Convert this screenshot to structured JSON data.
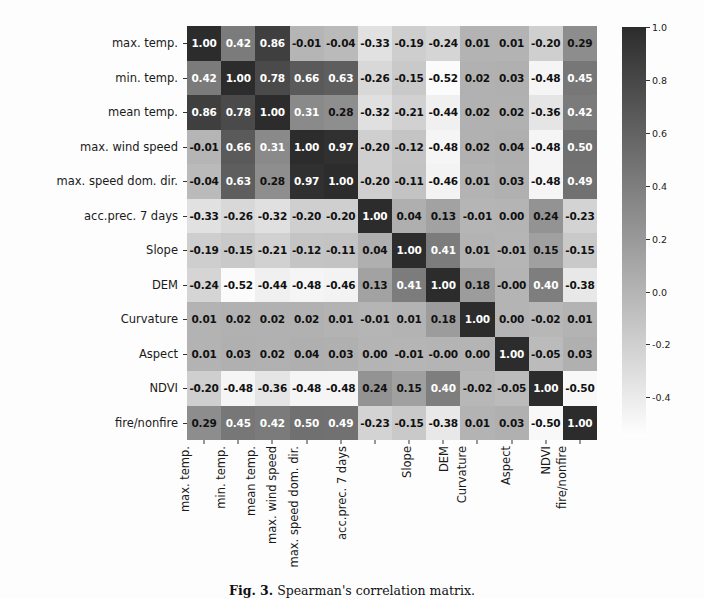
{
  "figure": {
    "caption_label": "Fig. 3.",
    "caption_text": "Spearman's correlation matrix."
  },
  "colorbar": {
    "ticks": [
      "1.0",
      "0.8",
      "0.6",
      "0.4",
      "0.2",
      "0.0",
      "-0.2",
      "-0.4"
    ],
    "tick_values": [
      1.0,
      0.8,
      0.6,
      0.4,
      0.2,
      0.0,
      -0.2,
      -0.4
    ],
    "vmin": -0.55,
    "vmax": 1.0,
    "low_color": "#ffffff",
    "high_color": "#2c2c2c",
    "orientation": "vertical"
  },
  "chart_data": {
    "type": "heatmap",
    "title": "",
    "xlabel": "",
    "ylabel": "",
    "categories": [
      "max. temp.",
      "min. temp.",
      "mean temp.",
      "max. wind speed",
      "max. speed dom. dir.",
      "acc.prec. 7 days",
      "Slope",
      "DEM",
      "Curvature",
      "Aspect",
      "NDVI",
      "fire/nonfire"
    ],
    "x_categories": [
      "max. temp.",
      "min. temp.",
      "mean temp.",
      "max. wind speed",
      "max. speed dom. dir.",
      "acc.prec. 7 days",
      "Slope",
      "DEM",
      "Curvature",
      "Aspect",
      "NDVI",
      "fire/nonfire"
    ],
    "y_categories": [
      "max. temp.",
      "min. temp.",
      "mean temp.",
      "max. wind speed",
      "max. speed dom. dir.",
      "acc.prec. 7 days",
      "Slope",
      "DEM",
      "Curvature",
      "Aspect",
      "NDVI",
      "fire/nonfire"
    ],
    "colormap": "gray_reversed",
    "zlim": [
      -0.55,
      1.0
    ],
    "annotated": true,
    "grid": false,
    "legend": "colorbar-right",
    "values": [
      [
        1.0,
        0.42,
        0.86,
        -0.01,
        -0.04,
        -0.33,
        -0.19,
        -0.24,
        0.01,
        0.01,
        -0.2,
        0.29
      ],
      [
        0.42,
        1.0,
        0.78,
        0.66,
        0.63,
        -0.26,
        -0.15,
        -0.52,
        0.02,
        0.03,
        -0.48,
        0.45
      ],
      [
        0.86,
        0.78,
        1.0,
        0.31,
        0.28,
        -0.32,
        -0.21,
        -0.44,
        0.02,
        0.02,
        -0.36,
        0.42
      ],
      [
        -0.01,
        0.66,
        0.31,
        1.0,
        0.97,
        -0.2,
        -0.12,
        -0.48,
        0.02,
        0.04,
        -0.48,
        0.5
      ],
      [
        -0.04,
        0.63,
        0.28,
        0.97,
        1.0,
        -0.2,
        -0.11,
        -0.46,
        0.01,
        0.03,
        -0.48,
        0.49
      ],
      [
        -0.33,
        -0.26,
        -0.32,
        -0.2,
        -0.2,
        1.0,
        0.04,
        0.13,
        -0.01,
        0.0,
        0.24,
        -0.23
      ],
      [
        -0.19,
        -0.15,
        -0.21,
        -0.12,
        -0.11,
        0.04,
        1.0,
        0.41,
        0.01,
        -0.01,
        0.15,
        -0.15
      ],
      [
        -0.24,
        -0.52,
        -0.44,
        -0.48,
        -0.46,
        0.13,
        0.41,
        1.0,
        0.18,
        -0.0,
        0.4,
        -0.38
      ],
      [
        0.01,
        0.02,
        0.02,
        0.02,
        0.01,
        -0.01,
        0.01,
        0.18,
        1.0,
        0.0,
        -0.02,
        0.01
      ],
      [
        0.01,
        0.03,
        0.02,
        0.04,
        0.03,
        0.0,
        -0.01,
        -0.0,
        0.0,
        1.0,
        -0.05,
        0.03
      ],
      [
        -0.2,
        -0.48,
        -0.36,
        -0.48,
        -0.48,
        0.24,
        0.15,
        0.4,
        -0.02,
        -0.05,
        1.0,
        -0.5
      ],
      [
        0.29,
        0.45,
        0.42,
        0.5,
        0.49,
        -0.23,
        -0.15,
        -0.38,
        0.01,
        0.03,
        -0.5,
        1.0
      ]
    ],
    "labels": [
      [
        "1.00",
        "0.42",
        "0.86",
        "-0.01",
        "-0.04",
        "-0.33",
        "-0.19",
        "-0.24",
        "0.01",
        "0.01",
        "-0.20",
        "0.29"
      ],
      [
        "0.42",
        "1.00",
        "0.78",
        "0.66",
        "0.63",
        "-0.26",
        "-0.15",
        "-0.52",
        "0.02",
        "0.03",
        "-0.48",
        "0.45"
      ],
      [
        "0.86",
        "0.78",
        "1.00",
        "0.31",
        "0.28",
        "-0.32",
        "-0.21",
        "-0.44",
        "0.02",
        "0.02",
        "-0.36",
        "0.42"
      ],
      [
        "-0.01",
        "0.66",
        "0.31",
        "1.00",
        "0.97",
        "-0.20",
        "-0.12",
        "-0.48",
        "0.02",
        "0.04",
        "-0.48",
        "0.50"
      ],
      [
        "-0.04",
        "0.63",
        "0.28",
        "0.97",
        "1.00",
        "-0.20",
        "-0.11",
        "-0.46",
        "0.01",
        "0.03",
        "-0.48",
        "0.49"
      ],
      [
        "-0.33",
        "-0.26",
        "-0.32",
        "-0.20",
        "-0.20",
        "1.00",
        "0.04",
        "0.13",
        "-0.01",
        "0.00",
        "0.24",
        "-0.23"
      ],
      [
        "-0.19",
        "-0.15",
        "-0.21",
        "-0.12",
        "-0.11",
        "0.04",
        "1.00",
        "0.41",
        "0.01",
        "-0.01",
        "0.15",
        "-0.15"
      ],
      [
        "-0.24",
        "-0.52",
        "-0.44",
        "-0.48",
        "-0.46",
        "0.13",
        "0.41",
        "1.00",
        "0.18",
        "-0.00",
        "0.40",
        "-0.38"
      ],
      [
        "0.01",
        "0.02",
        "0.02",
        "0.02",
        "0.01",
        "-0.01",
        "0.01",
        "0.18",
        "1.00",
        "0.00",
        "-0.02",
        "0.01"
      ],
      [
        "0.01",
        "0.03",
        "0.02",
        "0.04",
        "0.03",
        "0.00",
        "-0.01",
        "-0.00",
        "0.00",
        "1.00",
        "-0.05",
        "0.03"
      ],
      [
        "-0.20",
        "-0.48",
        "-0.36",
        "-0.48",
        "-0.48",
        "0.24",
        "0.15",
        "0.40",
        "-0.02",
        "-0.05",
        "1.00",
        "-0.50"
      ],
      [
        "0.29",
        "0.45",
        "0.42",
        "0.50",
        "0.49",
        "-0.23",
        "-0.15",
        "-0.38",
        "0.01",
        "0.03",
        "-0.50",
        "1.00"
      ]
    ]
  }
}
